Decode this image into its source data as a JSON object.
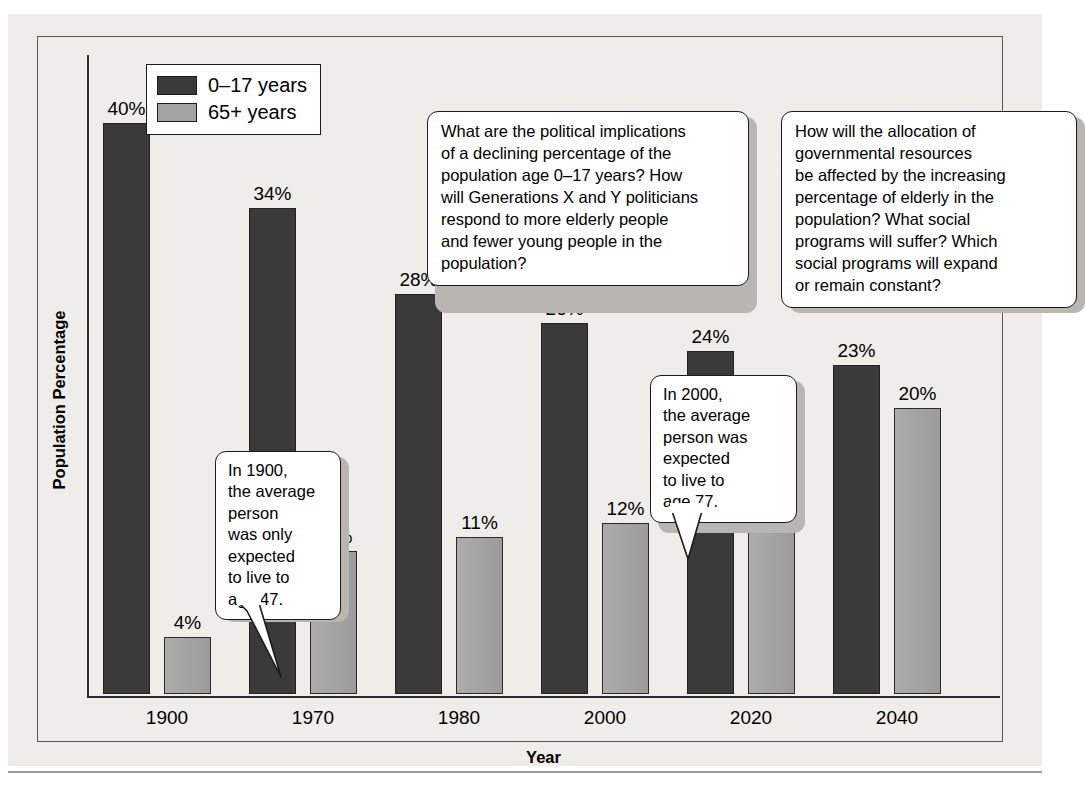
{
  "chart_data": {
    "type": "bar",
    "title": "",
    "xlabel": "Year",
    "ylabel": "Population Percentage",
    "categories": [
      "1900",
      "1970",
      "1980",
      "2000",
      "2020",
      "2040"
    ],
    "ylim": [
      0,
      42
    ],
    "grid": false,
    "legend_position": "top-left-inside",
    "value_suffix": "%",
    "series": [
      {
        "name": "0–17 years",
        "color": "#3a3a3a",
        "values": [
          40,
          34,
          28,
          26,
          24,
          23
        ],
        "labels": [
          "40%",
          "34%",
          "28%",
          "26%",
          "24%",
          "23%"
        ]
      },
      {
        "name": "65+ years",
        "color": "#a3a3a3",
        "values": [
          4,
          10,
          11,
          12,
          17,
          20
        ],
        "labels": [
          "4%",
          "10%",
          "11%",
          "12%",
          "17%",
          "20%"
        ]
      }
    ],
    "annotations": [
      {
        "id": "callout-1900",
        "text": "In 1900, the average person was only expected to live to age 47.",
        "lines": [
          "In 1900,",
          "the average",
          "person",
          "was only",
          "expected",
          "to live to",
          "age 47."
        ],
        "points_to": "1900 / 65+ years bar"
      },
      {
        "id": "callout-2000",
        "text": "In 2000, the average person was expected to live to age 77.",
        "lines": [
          "In 2000,",
          "the average",
          "person was",
          "expected",
          "to live to",
          "age 77."
        ],
        "points_to": "2000 / 65+ years bar"
      },
      {
        "id": "question-box-1",
        "text": "What are the political implications of a declining percentage of the population age 0–17 years? How will Generations X and Y politicians respond to more elderly people and fewer young people in the population?",
        "lines": [
          "What are the political implications",
          "of a declining percentage of the",
          "population age 0–17 years? How",
          "will Generations X and Y politicians",
          "respond to more elderly people",
          "and fewer young people in the",
          "population?"
        ]
      },
      {
        "id": "question-box-2",
        "text": "How will the allocation of governmental resources be affected by the increasing percentage of elderly in the population? What social programs will suffer? Which social programs will expand or remain constant?",
        "lines": [
          "How will the allocation of",
          "governmental resources",
          "be affected by the increasing",
          "percentage of elderly in the",
          "population? What social",
          "programs will suffer? Which",
          "social programs will expand",
          "or remain constant?"
        ]
      }
    ]
  },
  "legend": {
    "items": [
      {
        "label": "0–17 years",
        "swatch": "young"
      },
      {
        "label": "65+ years",
        "swatch": "old"
      }
    ]
  },
  "axes": {
    "y_title": "Population Percentage",
    "x_title": "Year"
  },
  "colors": {
    "young_bar": "#3a3a3a",
    "old_bar": "#a3a3a3",
    "paper": "#efedea",
    "frame": "#5a5a5a",
    "axis": "#2b2b2b",
    "box_shadow": "#b9b6b1"
  }
}
